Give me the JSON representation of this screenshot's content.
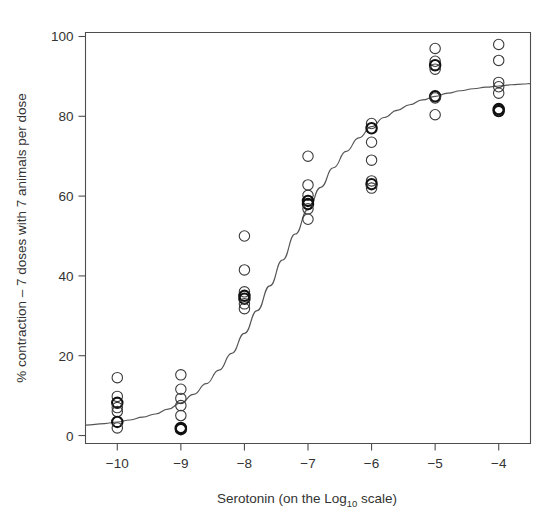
{
  "chart_data": {
    "type": "scatter",
    "title": "",
    "subtitle": "",
    "xlabel_parts": {
      "before": "Serotonin (on the Log",
      "subscript": "10",
      "after": " scale)"
    },
    "xlabel": "Serotonin (on the Log10 scale)",
    "ylabel": "% contraction – 7 doses with 7 animals per dose",
    "xlim": [
      -10.5,
      -3.5
    ],
    "ylim": [
      -2,
      101
    ],
    "xticks": [
      -10,
      -9,
      -8,
      -7,
      -6,
      -5,
      -4
    ],
    "xticklabels": [
      "−10",
      "−9",
      "−8",
      "−7",
      "−6",
      "−5",
      "−4"
    ],
    "yticks": [
      0,
      20,
      40,
      60,
      80,
      100
    ],
    "yticklabels": [
      "0",
      "20",
      "40",
      "60",
      "80",
      "100"
    ],
    "grid": false,
    "legend": null,
    "marker": "open-circle",
    "point_color": "#3a3a3a",
    "curve_color": "#555555",
    "axis_color": "#4d4d4d",
    "background": "#ffffff",
    "series": [
      {
        "name": "observed % contraction",
        "marker": "open-circle",
        "points": [
          {
            "x": -10,
            "y": 14.5,
            "bold": false
          },
          {
            "x": -10,
            "y": 9.8,
            "bold": false
          },
          {
            "x": -10,
            "y": 8.2,
            "bold": true
          },
          {
            "x": -10,
            "y": 7.0,
            "bold": false
          },
          {
            "x": -10,
            "y": 6.0,
            "bold": false
          },
          {
            "x": -10,
            "y": 3.4,
            "bold": true
          },
          {
            "x": -10,
            "y": 1.9,
            "bold": false
          },
          {
            "x": -9,
            "y": 15.2,
            "bold": false
          },
          {
            "x": -9,
            "y": 11.6,
            "bold": false
          },
          {
            "x": -9,
            "y": 9.3,
            "bold": false
          },
          {
            "x": -9,
            "y": 7.5,
            "bold": false
          },
          {
            "x": -9,
            "y": 5.0,
            "bold": false
          },
          {
            "x": -9,
            "y": 1.9,
            "bold": true
          },
          {
            "x": -9,
            "y": 1.6,
            "bold": true
          },
          {
            "x": -8,
            "y": 50.0,
            "bold": false
          },
          {
            "x": -8,
            "y": 41.5,
            "bold": false
          },
          {
            "x": -8,
            "y": 36.0,
            "bold": false
          },
          {
            "x": -8,
            "y": 35.0,
            "bold": true
          },
          {
            "x": -8,
            "y": 34.3,
            "bold": true
          },
          {
            "x": -8,
            "y": 33.0,
            "bold": false
          },
          {
            "x": -8,
            "y": 31.8,
            "bold": false
          },
          {
            "x": -7,
            "y": 70.0,
            "bold": false
          },
          {
            "x": -7,
            "y": 62.8,
            "bold": false
          },
          {
            "x": -7,
            "y": 60.2,
            "bold": false
          },
          {
            "x": -7,
            "y": 58.8,
            "bold": true
          },
          {
            "x": -7,
            "y": 58.0,
            "bold": true
          },
          {
            "x": -7,
            "y": 56.8,
            "bold": false
          },
          {
            "x": -7,
            "y": 54.2,
            "bold": false
          },
          {
            "x": -6,
            "y": 78.2,
            "bold": false
          },
          {
            "x": -6,
            "y": 77.0,
            "bold": true
          },
          {
            "x": -6,
            "y": 73.5,
            "bold": false
          },
          {
            "x": -6,
            "y": 69.0,
            "bold": false
          },
          {
            "x": -6,
            "y": 63.8,
            "bold": false
          },
          {
            "x": -6,
            "y": 63.0,
            "bold": true
          },
          {
            "x": -6,
            "y": 62.0,
            "bold": false
          },
          {
            "x": -5,
            "y": 97.0,
            "bold": false
          },
          {
            "x": -5,
            "y": 93.8,
            "bold": false
          },
          {
            "x": -5,
            "y": 92.8,
            "bold": true
          },
          {
            "x": -5,
            "y": 91.8,
            "bold": false
          },
          {
            "x": -5,
            "y": 85.0,
            "bold": true
          },
          {
            "x": -5,
            "y": 84.6,
            "bold": false
          },
          {
            "x": -5,
            "y": 80.4,
            "bold": false
          },
          {
            "x": -4,
            "y": 98.0,
            "bold": false
          },
          {
            "x": -4,
            "y": 94.0,
            "bold": false
          },
          {
            "x": -4,
            "y": 88.5,
            "bold": false
          },
          {
            "x": -4,
            "y": 87.4,
            "bold": false
          },
          {
            "x": -4,
            "y": 85.8,
            "bold": false
          },
          {
            "x": -4,
            "y": 81.8,
            "bold": true
          },
          {
            "x": -4,
            "y": 81.3,
            "bold": true
          }
        ]
      }
    ],
    "fitted_curve": {
      "name": "fitted logistic dose-response curve",
      "points": [
        {
          "x": -10.5,
          "y": 2.6
        },
        {
          "x": -10.2,
          "y": 3.0
        },
        {
          "x": -10.0,
          "y": 3.4
        },
        {
          "x": -9.8,
          "y": 3.9
        },
        {
          "x": -9.6,
          "y": 4.6
        },
        {
          "x": -9.4,
          "y": 5.4
        },
        {
          "x": -9.2,
          "y": 6.6
        },
        {
          "x": -9.0,
          "y": 8.2
        },
        {
          "x": -8.8,
          "y": 10.3
        },
        {
          "x": -8.6,
          "y": 13.0
        },
        {
          "x": -8.4,
          "y": 16.4
        },
        {
          "x": -8.2,
          "y": 20.6
        },
        {
          "x": -8.0,
          "y": 25.6
        },
        {
          "x": -7.8,
          "y": 31.3
        },
        {
          "x": -7.6,
          "y": 37.5
        },
        {
          "x": -7.4,
          "y": 44.0
        },
        {
          "x": -7.2,
          "y": 50.5
        },
        {
          "x": -7.0,
          "y": 56.6
        },
        {
          "x": -6.8,
          "y": 62.2
        },
        {
          "x": -6.6,
          "y": 67.1
        },
        {
          "x": -6.4,
          "y": 71.2
        },
        {
          "x": -6.2,
          "y": 74.6
        },
        {
          "x": -6.0,
          "y": 77.4
        },
        {
          "x": -5.8,
          "y": 79.7
        },
        {
          "x": -5.6,
          "y": 81.5
        },
        {
          "x": -5.4,
          "y": 82.9
        },
        {
          "x": -5.2,
          "y": 84.1
        },
        {
          "x": -5.0,
          "y": 85.0
        },
        {
          "x": -4.8,
          "y": 85.8
        },
        {
          "x": -4.6,
          "y": 86.4
        },
        {
          "x": -4.4,
          "y": 86.9
        },
        {
          "x": -4.2,
          "y": 87.3
        },
        {
          "x": -4.0,
          "y": 87.6
        },
        {
          "x": -3.8,
          "y": 87.9
        },
        {
          "x": -3.6,
          "y": 88.1
        },
        {
          "x": -3.5,
          "y": 88.2
        }
      ]
    }
  }
}
